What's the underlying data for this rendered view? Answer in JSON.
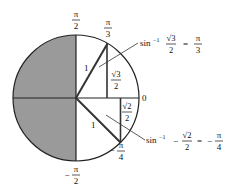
{
  "diagram": {
    "type": "unit-circle-inverse-sine",
    "center": {
      "x": 76,
      "y": 98
    },
    "radius": 63,
    "colors": {
      "shaded": "#9a9a9a",
      "stroke": "#222222",
      "background": "#ffffff"
    },
    "angle_labels": {
      "top": {
        "num": "π",
        "den": "2"
      },
      "bottom": {
        "sign": "−",
        "num": "π",
        "den": "2"
      },
      "right": "0",
      "pi_over_3": {
        "num": "π",
        "den": "3"
      },
      "neg_pi_over_4": {
        "sign": "−",
        "num": "π",
        "den": "4"
      }
    },
    "triangle_upper": {
      "hypotenuse_label": "1",
      "side_label": {
        "num": "√3",
        "den": "2"
      }
    },
    "triangle_lower": {
      "hypotenuse_label": "1",
      "side_label": {
        "num": "√2",
        "den": "2"
      }
    },
    "annotations": [
      {
        "func": "sin",
        "exp": "−1",
        "arg_sign": "",
        "arg_num": "√3",
        "arg_den": "2",
        "equals": "=",
        "result_sign": "",
        "result_num": "π",
        "result_den": "3"
      },
      {
        "func": "sin",
        "exp": "−1",
        "arg_sign": "−",
        "arg_num": "√2",
        "arg_den": "2",
        "equals": "=",
        "result_sign": "−",
        "result_num": "π",
        "result_den": "4"
      }
    ]
  }
}
